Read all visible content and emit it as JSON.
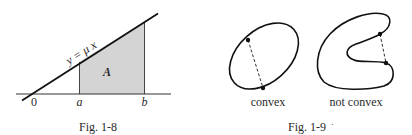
{
  "figures": [
    {
      "id": "fig-1-8",
      "caption": "Fig. 1-8",
      "line_label": "y = μ x",
      "area_label": "A",
      "axis_labels": {
        "origin": "0",
        "a": "a",
        "b": "b"
      }
    },
    {
      "id": "fig-1-9",
      "caption": "Fig. 1-9",
      "caption_trailing_mark": "·",
      "shapes": [
        {
          "label": "convex"
        },
        {
          "label": "not convex"
        }
      ]
    }
  ],
  "colors": {
    "ink": "#1a1a1a",
    "shade": "#d4d4d4",
    "text": "#2a2a2a"
  }
}
